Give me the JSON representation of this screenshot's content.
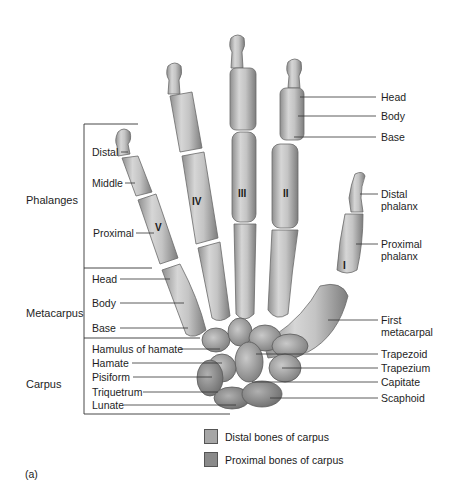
{
  "figure": {
    "caption": "(a)",
    "groups": {
      "phalanges": "Phalanges",
      "metacarpus": "Metacarpus",
      "carpus": "Carpus"
    },
    "left_labels": {
      "distal": "Distal",
      "middle": "Middle",
      "proximal": "Proximal",
      "head": "Head",
      "body": "Body",
      "base": "Base",
      "hamulus_of_hamate": "Hamulus of hamate",
      "hamate": "Hamate",
      "pisiform": "Pisiform",
      "triquetrum": "Triquetrum",
      "lunate": "Lunate"
    },
    "right_labels": {
      "head": "Head",
      "body": "Body",
      "base": "Base",
      "distal_phalanx_1": "Distal",
      "distal_phalanx_2": "phalanx",
      "proximal_phalanx_1": "Proximal",
      "proximal_phalanx_2": "phalanx",
      "first_metacarpal_1": "First",
      "first_metacarpal_2": "metacarpal",
      "trapezoid": "Trapezoid",
      "trapezium": "Trapezium",
      "capitate": "Capitate",
      "scaphoid": "Scaphoid"
    },
    "digit_numerals": {
      "i": "I",
      "ii": "II",
      "iii": "III",
      "iv": "IV",
      "v": "V"
    },
    "legend": [
      {
        "label": "Distal bones of carpus",
        "color": "#a6a6a6"
      },
      {
        "label": "Proximal bones of carpus",
        "color": "#8a8a8a"
      }
    ]
  }
}
